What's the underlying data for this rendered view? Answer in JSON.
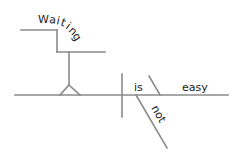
{
  "diagram": {
    "type": "sentence-diagram",
    "sentence": "Waiting is not easy",
    "line_color": "#8a8a8a",
    "text_color": "#222222",
    "labels": {
      "gerund": "Waiting",
      "verb": "is",
      "complement": "easy",
      "modifier": "not"
    },
    "gerund_letters": [
      "W",
      "a",
      "i",
      "t",
      "i",
      "n",
      "g"
    ]
  }
}
